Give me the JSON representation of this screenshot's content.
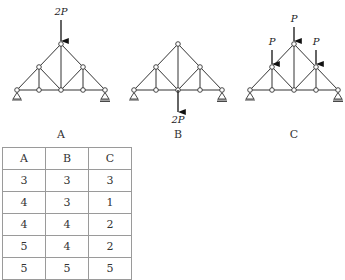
{
  "diagrams": [
    {
      "label": "A",
      "loads": [
        {
          "text": "2P",
          "node": "apex",
          "direction": "down-onto"
        }
      ]
    },
    {
      "label": "B",
      "loads": [
        {
          "text": "2P",
          "node": "bottom-center",
          "direction": "down-away"
        }
      ]
    },
    {
      "label": "C",
      "loads": [
        {
          "text": "P",
          "node": "upper-left",
          "direction": "down-onto"
        },
        {
          "text": "P",
          "node": "apex",
          "direction": "down-onto"
        },
        {
          "text": "P",
          "node": "upper-right",
          "direction": "down-onto"
        }
      ]
    }
  ],
  "table": {
    "headers": [
      "A",
      "B",
      "C"
    ],
    "rows": [
      [
        "3",
        "3",
        "3"
      ],
      [
        "4",
        "3",
        "1"
      ],
      [
        "4",
        "4",
        "2"
      ],
      [
        "5",
        "4",
        "2"
      ],
      [
        "5",
        "5",
        "5"
      ]
    ]
  }
}
